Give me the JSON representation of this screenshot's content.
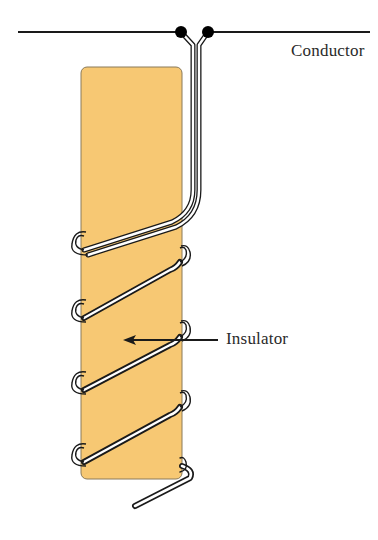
{
  "diagram": {
    "type": "coil-wound-insulator",
    "labels": {
      "conductor": "Conductor",
      "insulator": "Insulator"
    },
    "colors": {
      "insulator_fill": "#F7C873",
      "insulator_stroke": "#8a7a5a",
      "wire": "#1a1a1a",
      "terminal": "#000000",
      "background": "#ffffff",
      "text": "#2a2a2a"
    },
    "components": [
      {
        "id": "conductor-line",
        "kind": "horizontal line",
        "x1": 18,
        "x2": 370,
        "y": 32
      },
      {
        "id": "terminal-left",
        "kind": "dot",
        "cx": 181,
        "cy": 32
      },
      {
        "id": "terminal-right",
        "kind": "dot",
        "cx": 208,
        "cy": 32
      },
      {
        "id": "insulator-rod",
        "kind": "rounded rectangle",
        "x": 81,
        "y": 67,
        "width": 101,
        "height": 412
      },
      {
        "id": "coil-wire",
        "kind": "helical wire",
        "turns": 4
      },
      {
        "id": "insulator-arrow",
        "kind": "arrow",
        "from": [
          218,
          340
        ],
        "to": [
          124,
          340
        ]
      }
    ]
  }
}
